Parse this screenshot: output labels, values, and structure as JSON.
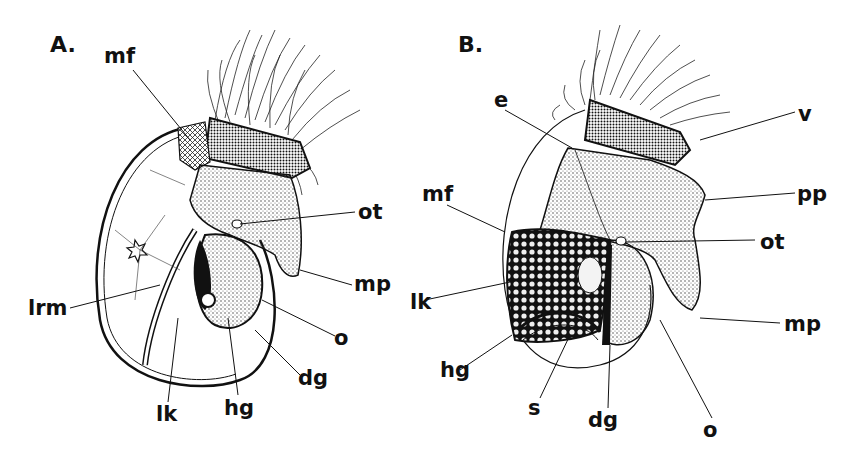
{
  "figure": {
    "panels": [
      {
        "id": "A",
        "title": "A.",
        "labels": [
          {
            "text": "mf",
            "x": 104,
            "y": 46
          },
          {
            "text": "ot",
            "x": 358,
            "y": 202
          },
          {
            "text": "mp",
            "x": 354,
            "y": 274
          },
          {
            "text": "lrm",
            "x": 28,
            "y": 298
          },
          {
            "text": "o",
            "x": 334,
            "y": 328
          },
          {
            "text": "dg",
            "x": 298,
            "y": 368
          },
          {
            "text": "lk",
            "x": 156,
            "y": 404
          },
          {
            "text": "hg",
            "x": 224,
            "y": 398
          }
        ]
      },
      {
        "id": "B",
        "title": "B.",
        "labels": [
          {
            "text": "e",
            "x": 494,
            "y": 90
          },
          {
            "text": "v",
            "x": 798,
            "y": 104
          },
          {
            "text": "mf",
            "x": 422,
            "y": 184
          },
          {
            "text": "pp",
            "x": 797,
            "y": 184
          },
          {
            "text": "ot",
            "x": 760,
            "y": 232
          },
          {
            "text": "lk",
            "x": 410,
            "y": 292
          },
          {
            "text": "mp",
            "x": 784,
            "y": 314
          },
          {
            "text": "hg",
            "x": 440,
            "y": 360
          },
          {
            "text": "s",
            "x": 528,
            "y": 398
          },
          {
            "text": "dg",
            "x": 588,
            "y": 410
          },
          {
            "text": "o",
            "x": 703,
            "y": 420
          }
        ]
      }
    ],
    "colors": {
      "ink": "#111111",
      "paper": "#ffffff",
      "stipple": "#555555"
    }
  }
}
